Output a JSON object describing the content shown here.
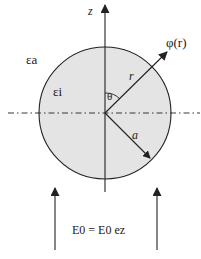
{
  "diagram": {
    "axis_label": "z",
    "outer_permittivity": "εa",
    "inner_permittivity": "εi",
    "angle_label": "θ",
    "radius_vector_label": "r",
    "potential_label": "φ(r)",
    "sphere_radius_label": "a",
    "field_equation": "E0 = E0 ez",
    "colors": {
      "sphere_fill": "#e4e4e4",
      "stroke": "#222222"
    }
  }
}
